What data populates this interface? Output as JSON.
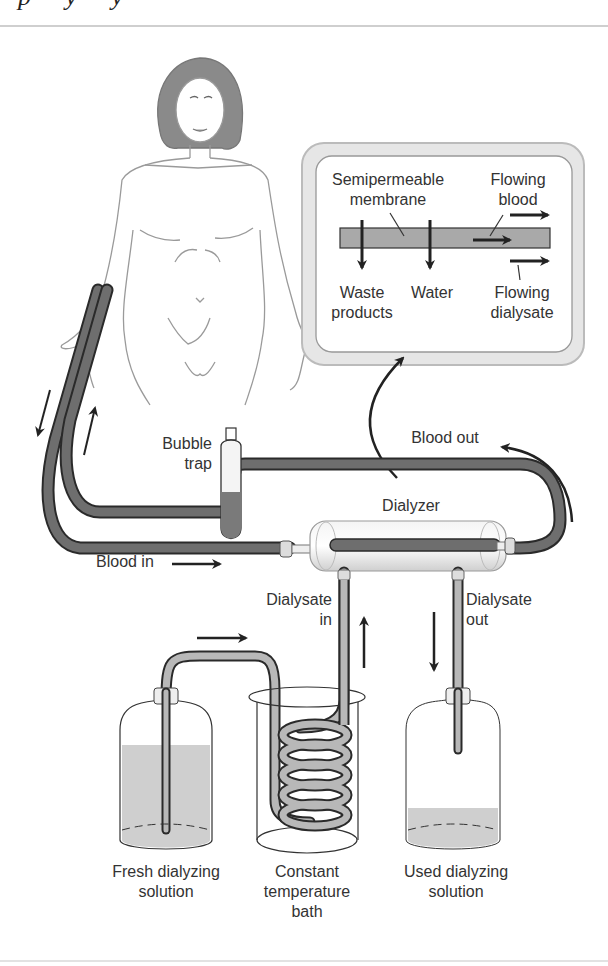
{
  "header": {
    "cropped_title": "p  y  y"
  },
  "inset": {
    "membrane_label_line1": "Semipermeable",
    "membrane_label_line2": "membrane",
    "flowing_blood_line1": "Flowing",
    "flowing_blood_line2": "blood",
    "waste_line1": "Waste",
    "waste_line2": "products",
    "water": "Water",
    "flowing_dialysate_line1": "Flowing",
    "flowing_dialysate_line2": "dialysate"
  },
  "labels": {
    "bubble_trap_line1": "Bubble",
    "bubble_trap_line2": "trap",
    "blood_out": "Blood out",
    "dialyzer": "Dialyzer",
    "blood_in": "Blood in",
    "dialysate_in_line1": "Dialysate",
    "dialysate_in_line2": "in",
    "dialysate_out_line1": "Dialysate",
    "dialysate_out_line2": "out",
    "fresh_line1": "Fresh dialyzing",
    "fresh_line2": "solution",
    "bath_line1": "Constant",
    "bath_line2": "temperature",
    "bath_line3": "bath",
    "used_line1": "Used dialyzing",
    "used_line2": "solution"
  },
  "colors": {
    "blood_tube": "#6e6e6e",
    "tube_outline": "#2a2a2a",
    "dialysate_tube": "#b8b8b8",
    "fluid": "#cfcfcf",
    "skin_outline": "#9a9a9a",
    "hair": "#8a8a8a",
    "arrow": "#222222"
  }
}
